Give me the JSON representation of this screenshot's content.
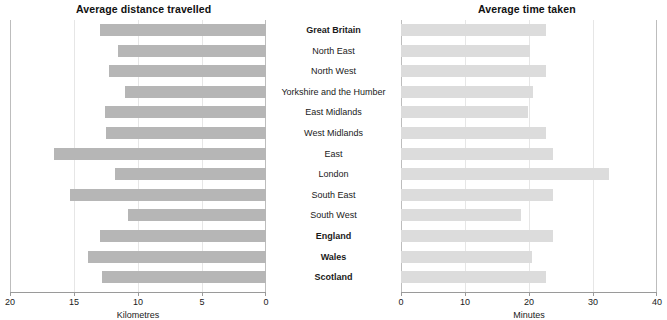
{
  "charts": {
    "left": {
      "title": "Average distance travelled",
      "axis_title": "Kilometres",
      "ticks": [
        "20",
        "15",
        "10",
        "5",
        "0"
      ]
    },
    "right": {
      "title": "Average time taken",
      "axis_title": "Minutes",
      "ticks": [
        "0",
        "10",
        "20",
        "30",
        "40"
      ]
    }
  },
  "regions": [
    {
      "label": "Great Britain",
      "bold": true
    },
    {
      "label": "North East",
      "bold": false
    },
    {
      "label": "North West",
      "bold": false
    },
    {
      "label": "Yorkshire and the Humber",
      "bold": false
    },
    {
      "label": "East Midlands",
      "bold": false
    },
    {
      "label": "West Midlands",
      "bold": false
    },
    {
      "label": "East",
      "bold": false
    },
    {
      "label": "London",
      "bold": false
    },
    {
      "label": "South East",
      "bold": false
    },
    {
      "label": "South West",
      "bold": false
    },
    {
      "label": "England",
      "bold": true
    },
    {
      "label": "Wales",
      "bold": true
    },
    {
      "label": "Scotland",
      "bold": true
    }
  ],
  "chart_data": [
    {
      "type": "bar",
      "orientation": "horizontal",
      "direction": "right-to-left",
      "title": "Average distance travelled",
      "xlabel": "Kilometres",
      "ylabel": "",
      "xlim": [
        20,
        0
      ],
      "xticks": [
        20,
        15,
        10,
        5,
        0
      ],
      "grid": true,
      "bar_color": "#b6b6b6",
      "categories": [
        "Great Britain",
        "North East",
        "North West",
        "Yorkshire and the Humber",
        "East Midlands",
        "West Midlands",
        "East",
        "London",
        "South East",
        "South West",
        "England",
        "Wales",
        "Scotland"
      ],
      "values": [
        13.0,
        11.6,
        12.3,
        11.0,
        12.6,
        12.5,
        16.6,
        11.8,
        15.3,
        10.8,
        13.0,
        13.9,
        12.8
      ]
    },
    {
      "type": "bar",
      "orientation": "horizontal",
      "direction": "left-to-right",
      "title": "Average time taken",
      "xlabel": "Minutes",
      "ylabel": "",
      "xlim": [
        0,
        40
      ],
      "xticks": [
        0,
        10,
        20,
        30,
        40
      ],
      "grid": true,
      "bar_color": "#dcdcdc",
      "categories": [
        "Great Britain",
        "North East",
        "North West",
        "Yorkshire and the Humber",
        "East Midlands",
        "West Midlands",
        "East",
        "London",
        "South East",
        "South West",
        "England",
        "Wales",
        "Scotland"
      ],
      "values": [
        22.6,
        20.1,
        22.6,
        20.7,
        19.8,
        22.6,
        23.7,
        32.5,
        23.7,
        18.7,
        23.7,
        20.4,
        22.6
      ]
    }
  ]
}
